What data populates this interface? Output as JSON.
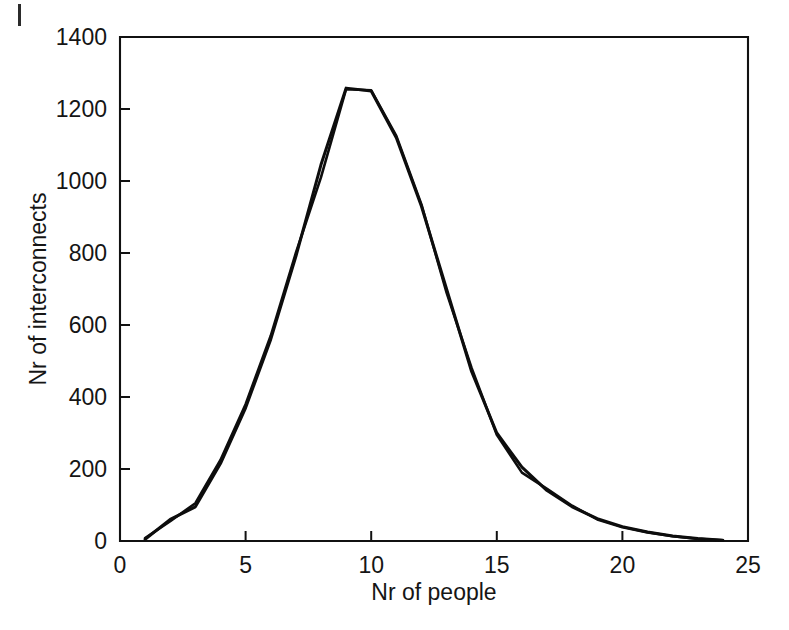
{
  "chart_data": {
    "type": "line",
    "title": "",
    "xlabel": "Nr of people",
    "ylabel": "Nr of interconnects",
    "xlim": [
      0,
      25
    ],
    "ylim": [
      0,
      1400
    ],
    "xticks": [
      0,
      5,
      10,
      15,
      20,
      25
    ],
    "yticks": [
      0,
      200,
      400,
      600,
      800,
      1000,
      1200,
      1400
    ],
    "grid": false,
    "legend": "none",
    "line_color": "#0d0d0d",
    "x": [
      1,
      2,
      3,
      4,
      5,
      6,
      7,
      8,
      9,
      10,
      11,
      12,
      13,
      14,
      15,
      16,
      17,
      18,
      19,
      20,
      21,
      22,
      23,
      24
    ],
    "series": [
      {
        "name": "measured",
        "values": [
          5,
          60,
          95,
          215,
          370,
          560,
          790,
          1045,
          1258,
          1250,
          1120,
          930,
          700,
          470,
          300,
          205,
          140,
          95,
          62,
          40,
          25,
          14,
          7,
          2
        ]
      },
      {
        "name": "model",
        "values": [
          8,
          55,
          105,
          225,
          380,
          570,
          800,
          1010,
          1255,
          1252,
          1125,
          935,
          690,
          480,
          295,
          190,
          145,
          98,
          60,
          38,
          24,
          13,
          6,
          2
        ]
      }
    ],
    "peak": {
      "x": 9,
      "y": 1258
    },
    "xtick_labels": [
      "0",
      "5",
      "10",
      "15",
      "20",
      "25"
    ],
    "ytick_labels": [
      "0",
      "200",
      "400",
      "600",
      "800",
      "1000",
      "1200",
      "1400"
    ]
  },
  "figure": {
    "background_color": "#ffffff",
    "axis_color": "#111111"
  }
}
